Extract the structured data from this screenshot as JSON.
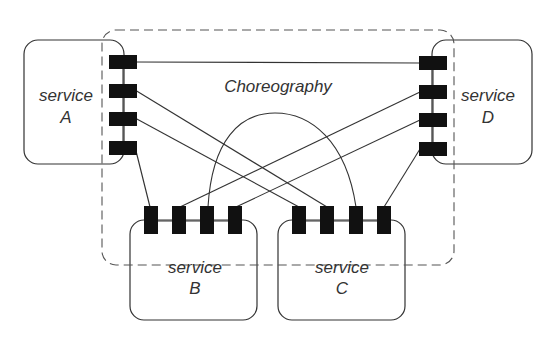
{
  "diagram": {
    "title": "Choreography",
    "services": [
      {
        "id": "A",
        "line1": "service",
        "line2": "A"
      },
      {
        "id": "B",
        "line1": "service",
        "line2": "B"
      },
      {
        "id": "C",
        "line1": "service",
        "line2": "C"
      },
      {
        "id": "D",
        "line1": "service",
        "line2": "D"
      }
    ],
    "connections": [
      {
        "from": "A.port1",
        "to": "D.port1"
      },
      {
        "from": "A.port2",
        "to": "C.port2"
      },
      {
        "from": "A.port3",
        "to": "C.port1"
      },
      {
        "from": "A.port4",
        "to": "B.port1"
      },
      {
        "from": "D.port2",
        "to": "B.port2"
      },
      {
        "from": "D.port3",
        "to": "B.port4"
      },
      {
        "from": "D.port4",
        "to": "C.port4"
      },
      {
        "from": "B.port3",
        "to": "C.port3"
      }
    ],
    "colors": {
      "line": "#333333",
      "port": "#111111",
      "dashed_boundary": "#555555"
    }
  }
}
